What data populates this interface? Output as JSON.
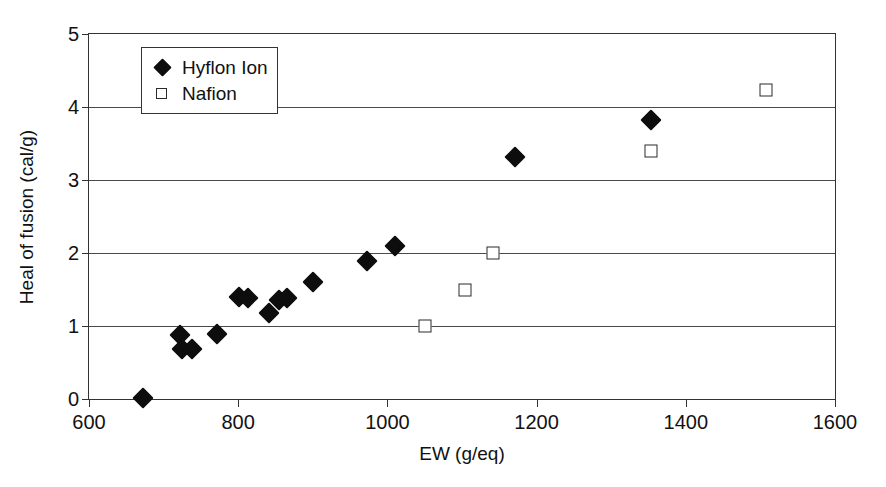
{
  "chart_data": {
    "type": "scatter",
    "title": "",
    "xlabel": "EW (g/eq)",
    "ylabel": "Heal of fusion (cal/g)",
    "xlim": [
      600,
      1600
    ],
    "ylim": [
      0,
      5
    ],
    "xticks": [
      600,
      800,
      1000,
      1200,
      1400,
      1600
    ],
    "yticks": [
      0,
      1,
      2,
      3,
      4,
      5
    ],
    "grid": "horizontal",
    "legend_position": "top-left-inside",
    "series": [
      {
        "name": "Hyflon Ion",
        "marker": "filled-diamond",
        "color": "#0d0d0d",
        "points": [
          {
            "x": 672,
            "y": 0.02
          },
          {
            "x": 722,
            "y": 0.87
          },
          {
            "x": 724,
            "y": 0.68
          },
          {
            "x": 738,
            "y": 0.69
          },
          {
            "x": 772,
            "y": 0.89
          },
          {
            "x": 801,
            "y": 1.4
          },
          {
            "x": 813,
            "y": 1.39
          },
          {
            "x": 841,
            "y": 1.18
          },
          {
            "x": 855,
            "y": 1.35
          },
          {
            "x": 866,
            "y": 1.39
          },
          {
            "x": 900,
            "y": 1.6
          },
          {
            "x": 972,
            "y": 1.89
          },
          {
            "x": 1010,
            "y": 2.1
          },
          {
            "x": 1171,
            "y": 3.32
          },
          {
            "x": 1354,
            "y": 3.82
          }
        ]
      },
      {
        "name": "Nafion",
        "marker": "open-square",
        "color": "#2b2b2b",
        "points": [
          {
            "x": 1051,
            "y": 1.0
          },
          {
            "x": 1104,
            "y": 1.49
          },
          {
            "x": 1142,
            "y": 2.0
          },
          {
            "x": 1354,
            "y": 3.4
          },
          {
            "x": 1508,
            "y": 4.23
          }
        ]
      }
    ]
  },
  "legend": {
    "entries": [
      {
        "label": "Hyflon Ion",
        "marker": "filled-diamond"
      },
      {
        "label": "Nafion",
        "marker": "open-square"
      }
    ]
  }
}
